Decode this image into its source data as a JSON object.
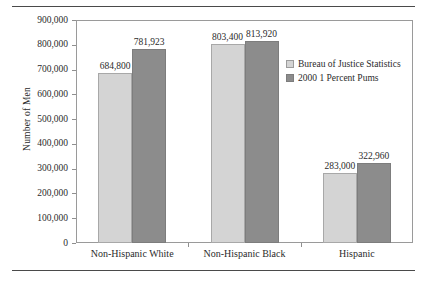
{
  "chart_data": {
    "type": "bar",
    "title": "",
    "xlabel": "",
    "ylabel": "Number of Men",
    "ylim": [
      0,
      900000
    ],
    "ytick_labels": [
      "0",
      "100,000",
      "200,000",
      "300,000",
      "400,000",
      "500,000",
      "600,000",
      "700,000",
      "800,000",
      "900,000"
    ],
    "ytick_values": [
      0,
      100000,
      200000,
      300000,
      400000,
      500000,
      600000,
      700000,
      800000,
      900000
    ],
    "grid": false,
    "legend_position": "upper right inside",
    "categories": [
      "Non-Hispanic White",
      "Non-Hispanic Black",
      "Hispanic"
    ],
    "series": [
      {
        "name": "Bureau of Justice Statistics",
        "color": "#d4d4d4",
        "values": [
          684800,
          803400,
          283000
        ],
        "labels": [
          "684,800",
          "803,400",
          "283,000"
        ]
      },
      {
        "name": "2000 1 Percent Pums",
        "color": "#8c8c8c",
        "values": [
          781923,
          813920,
          322960
        ],
        "labels": [
          "781,923",
          "813,920",
          "322,960"
        ]
      }
    ]
  },
  "legend": {
    "items": [
      {
        "label": "Bureau of Justice Statistics"
      },
      {
        "label": "2000 1 Percent Pums"
      }
    ]
  }
}
